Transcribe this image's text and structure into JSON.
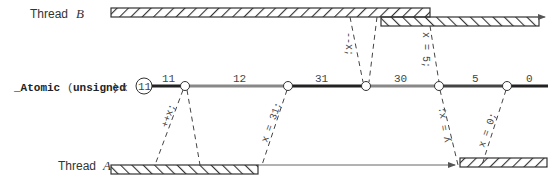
{
  "threads": {
    "b": {
      "label": "Thread",
      "name": "B"
    },
    "a": {
      "label": "Thread",
      "name": "A"
    }
  },
  "variable": {
    "prefix": "_Atomic",
    "open": "(",
    "type": "unsigned",
    "close": ")",
    "name": "x",
    "initial": "11"
  },
  "timeline_values": [
    "11",
    "12",
    "31",
    "30",
    "5",
    "0"
  ],
  "operations": {
    "a_increment": "++x;",
    "a_store": "x = 31;",
    "b_decrement": "--x;",
    "b_store": "x = 5;",
    "a_load": "y = x;",
    "a_zero": "x = 0;"
  },
  "colors": {
    "line_dark": "#222222",
    "line_gray": "#888888",
    "hatch": "#333333"
  }
}
